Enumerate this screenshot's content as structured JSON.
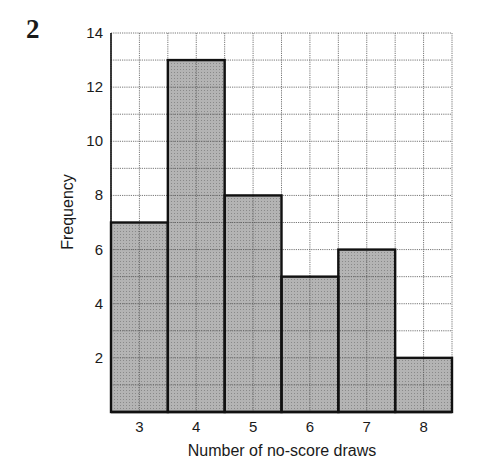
{
  "question_number": "2",
  "chart_data": {
    "type": "bar",
    "subtype": "histogram",
    "title": "",
    "xlabel": "Number of no-score draws",
    "ylabel": "Frequency",
    "categories": [
      "3",
      "4",
      "5",
      "6",
      "7",
      "8"
    ],
    "values": [
      7,
      13,
      8,
      5,
      6,
      2
    ],
    "ylim": [
      0,
      14
    ],
    "yticks": [
      "2",
      "4",
      "6",
      "8",
      "10",
      "12",
      "14"
    ],
    "grid": true,
    "grid_minor_step": 1,
    "legend": null,
    "bar_color": "#a8a8a8",
    "bar_edge_color": "#111111"
  }
}
